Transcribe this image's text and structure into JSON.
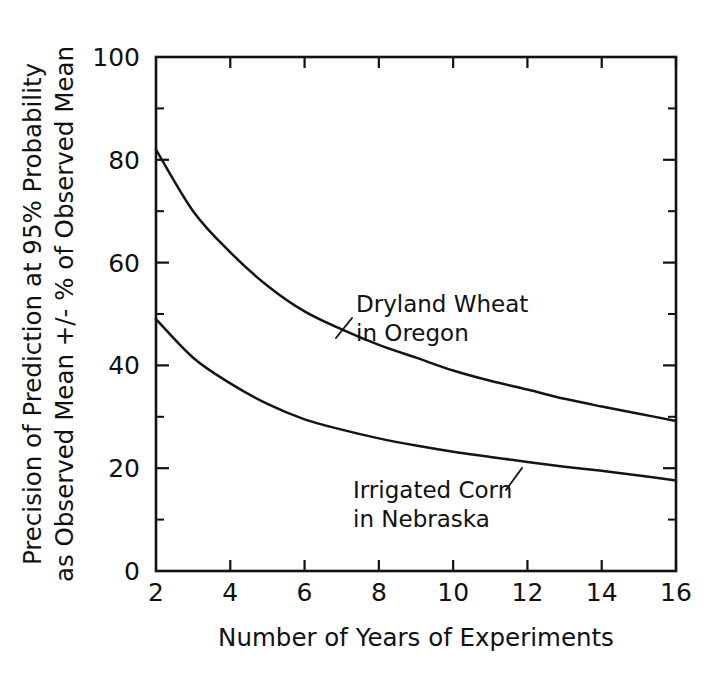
{
  "chart_data": {
    "type": "line",
    "title": "",
    "xlabel": "Number of Years of Experiments",
    "ylabel_line1": "Precision of Prediction at 95% Probability",
    "ylabel_line2": "as Observed Mean +/- % of Observed Mean",
    "xlim": [
      2,
      16
    ],
    "ylim": [
      0,
      100
    ],
    "grid": false,
    "legend_position": "inline-annotations",
    "x_ticks": [
      2,
      4,
      6,
      8,
      10,
      12,
      14,
      16
    ],
    "x_tick_labels": [
      "2",
      "4",
      "6",
      "8",
      "10",
      "12",
      "14",
      "16"
    ],
    "y_ticks": [
      0,
      20,
      40,
      60,
      80,
      100
    ],
    "y_tick_labels": [
      "0",
      "20",
      "40",
      "60",
      "80",
      "100"
    ],
    "y_minor_ticks": [
      10,
      30,
      50,
      70,
      90
    ],
    "x": [
      2,
      3,
      4,
      5,
      6,
      7,
      8,
      9,
      10,
      11,
      12,
      13,
      14,
      15,
      16
    ],
    "series": [
      {
        "name": "Dryland Wheat in Oregon",
        "annotation_line1": "Dryland Wheat",
        "annotation_line2": "in Oregon",
        "values": [
          82,
          70,
          62,
          55.5,
          50.5,
          47,
          44,
          41.5,
          39,
          37,
          35.3,
          33.5,
          32,
          30.6,
          29.2
        ]
      },
      {
        "name": "Irrigated Corn in Nebraska",
        "annotation_line1": "Irrigated Corn",
        "annotation_line2": "in Nebraska",
        "values": [
          49,
          41.5,
          36.5,
          32.5,
          29.5,
          27.5,
          25.8,
          24.4,
          23.2,
          22.2,
          21.2,
          20.3,
          19.5,
          18.6,
          17.6
        ]
      }
    ],
    "colors": {
      "line": "#141414",
      "axis": "#111111",
      "background": "#ffffff"
    }
  },
  "annotations": {
    "upper": {
      "line1": "Dryland Wheat",
      "line2": "in Oregon"
    },
    "lower": {
      "line1": "Irrigated Corn",
      "line2": "in Nebraska"
    }
  },
  "axes": {
    "x_title": "Number of Years of Experiments",
    "y_title_line1": "Precision of Prediction at 95% Probability",
    "y_title_line2": "as Observed Mean +/- % of Observed Mean",
    "x_tick_labels": [
      "2",
      "4",
      "6",
      "8",
      "10",
      "12",
      "14",
      "16"
    ],
    "y_tick_labels": [
      "0",
      "20",
      "40",
      "60",
      "80",
      "100"
    ]
  }
}
